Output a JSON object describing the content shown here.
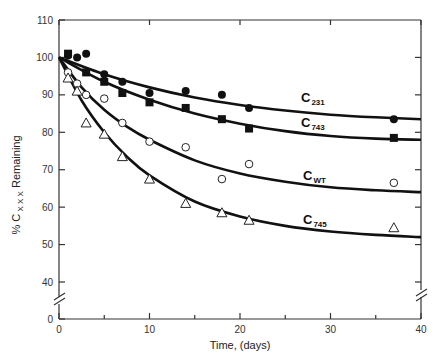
{
  "chart_data": {
    "type": "scatter",
    "title": "",
    "xlabel": "Time, (days)",
    "ylabel": "% C_XXX Remaining",
    "ylabel_parts": {
      "prefix": "% C",
      "subscript": "XXX",
      "suffix": " Remaining"
    },
    "xlim": [
      0,
      40
    ],
    "ylim": [
      0,
      110
    ],
    "y_axis_break": "between 0 and 40",
    "x_ticks": [
      0,
      10,
      20,
      30,
      40
    ],
    "x_minor_ticks": [
      5,
      15,
      25,
      35
    ],
    "y_ticks": [
      0,
      40,
      50,
      60,
      70,
      80,
      90,
      100,
      110
    ],
    "grid": false,
    "legend_position": "inline curve labels",
    "series": [
      {
        "name": "C231",
        "label_main": "C",
        "label_sub": "231",
        "marker": "filled-circle",
        "points": [
          [
            1,
            100.5
          ],
          [
            2,
            100
          ],
          [
            3,
            101
          ],
          [
            5,
            95.5
          ],
          [
            7,
            93.5
          ],
          [
            10,
            90.5
          ],
          [
            14,
            91
          ],
          [
            18,
            90
          ],
          [
            21,
            86.5
          ],
          [
            37,
            83.5
          ]
        ],
        "fit": [
          [
            0,
            100
          ],
          [
            5,
            95.5
          ],
          [
            10,
            92
          ],
          [
            15,
            89.3
          ],
          [
            20,
            87.3
          ],
          [
            25,
            85.8
          ],
          [
            30,
            84.7
          ],
          [
            35,
            84
          ],
          [
            40,
            83.5
          ]
        ]
      },
      {
        "name": "C743",
        "label_main": "C",
        "label_sub": "743",
        "marker": "filled-square",
        "points": [
          [
            1,
            101
          ],
          [
            3,
            96
          ],
          [
            5,
            93.5
          ],
          [
            7,
            90.5
          ],
          [
            10,
            88
          ],
          [
            14,
            86.5
          ],
          [
            18,
            83.5
          ],
          [
            21,
            81
          ],
          [
            37,
            78.5
          ]
        ],
        "fit": [
          [
            0,
            100
          ],
          [
            5,
            93.5
          ],
          [
            10,
            88.7
          ],
          [
            15,
            85
          ],
          [
            20,
            82.3
          ],
          [
            25,
            80.3
          ],
          [
            30,
            79
          ],
          [
            35,
            78.3
          ],
          [
            40,
            78
          ]
        ]
      },
      {
        "name": "CWT",
        "label_main": "C",
        "label_sub": "WT",
        "marker": "open-circle",
        "points": [
          [
            1,
            96
          ],
          [
            2,
            93
          ],
          [
            3,
            90
          ],
          [
            5,
            89
          ],
          [
            7,
            82.5
          ],
          [
            10,
            77.5
          ],
          [
            14,
            76
          ],
          [
            18,
            67.5
          ],
          [
            21,
            71.5
          ],
          [
            37,
            66.5
          ]
        ],
        "fit": [
          [
            0,
            100
          ],
          [
            2.5,
            92
          ],
          [
            5,
            86
          ],
          [
            7.5,
            81.5
          ],
          [
            10,
            78
          ],
          [
            15,
            72.5
          ],
          [
            20,
            69
          ],
          [
            25,
            66.8
          ],
          [
            30,
            65.3
          ],
          [
            35,
            64.5
          ],
          [
            40,
            64
          ]
        ]
      },
      {
        "name": "C745",
        "label_main": "C",
        "label_sub": "745",
        "marker": "open-triangle",
        "points": [
          [
            1,
            94.5
          ],
          [
            2,
            91
          ],
          [
            3,
            82.5
          ],
          [
            5,
            79.5
          ],
          [
            7,
            73.5
          ],
          [
            10,
            67.5
          ],
          [
            14,
            61
          ],
          [
            18,
            58.5
          ],
          [
            21,
            56.5
          ],
          [
            37,
            54.5
          ]
        ],
        "fit": [
          [
            0,
            100
          ],
          [
            2.5,
            88.5
          ],
          [
            5,
            80
          ],
          [
            7.5,
            73.5
          ],
          [
            10,
            68.5
          ],
          [
            15,
            61.5
          ],
          [
            20,
            57.5
          ],
          [
            25,
            55
          ],
          [
            30,
            53.5
          ],
          [
            35,
            52.6
          ],
          [
            40,
            52
          ]
        ]
      }
    ]
  }
}
